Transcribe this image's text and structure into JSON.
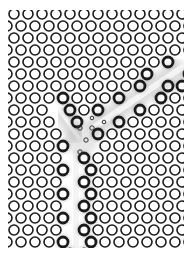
{
  "figure": {
    "background": "#ffffff",
    "lattice": {
      "type": "triangular",
      "clip": {
        "x": 8,
        "y": 10,
        "width": 176,
        "height": 238
      },
      "origin_x": 14,
      "origin_y": 14,
      "pitch_x": 14,
      "pitch_y": 12,
      "rows": 21,
      "cols": 14,
      "hole_radius": 5,
      "stroke": "#1a1a1a",
      "stroke_width": 1.6
    },
    "waveguides": [
      {
        "name": "vertical-output",
        "x1": 76,
        "y1": 150,
        "x2": 76,
        "y2": 250,
        "width": 12
      },
      {
        "name": "diagonal-input",
        "x1": 184,
        "y1": 66,
        "x2": 90,
        "y2": 130,
        "width": 12
      },
      {
        "name": "junction-arm",
        "x1": 60,
        "y1": 110,
        "x2": 80,
        "y2": 140,
        "width": 10
      }
    ],
    "field_color": "#9a9a9a",
    "junction_center": {
      "x": 82,
      "y": 140
    },
    "defect_holes": [
      {
        "x": 80,
        "y": 128,
        "r": 2.2
      },
      {
        "x": 92,
        "y": 128,
        "r": 2.2
      },
      {
        "x": 86,
        "y": 140,
        "r": 2.2
      },
      {
        "x": 80,
        "y": 152,
        "r": 2.2
      },
      {
        "x": 92,
        "y": 118,
        "r": 1.8
      },
      {
        "x": 104,
        "y": 122,
        "r": 1.8
      }
    ]
  }
}
